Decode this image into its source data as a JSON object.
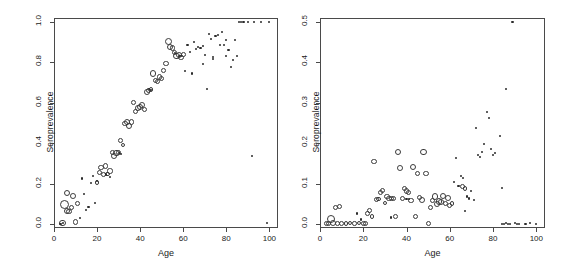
{
  "figure": {
    "background": "#ffffff",
    "frame_color": "#4a4a4a",
    "marker_color": "#3a3a3a"
  },
  "chart_data": [
    {
      "type": "scatter",
      "panel": "left",
      "title": "",
      "xlabel": "Age",
      "ylabel": "Seroprevalence",
      "xlim": [
        0,
        104
      ],
      "ylim": [
        -0.02,
        1.02
      ],
      "xticks": [
        0,
        20,
        40,
        60,
        80,
        100
      ],
      "xtick_labels": [
        "0",
        "20",
        "40",
        "60",
        "80",
        "100"
      ],
      "yticks": [
        0.0,
        0.2,
        0.4,
        0.6,
        0.8,
        1.0
      ],
      "ytick_labels": [
        "0.0",
        "0.2",
        "0.4",
        "0.6",
        "0.8",
        "1.0"
      ],
      "grid": false,
      "legend": "none",
      "series": [
        {
          "name": "weighted-open-circles",
          "marker": "open-circle",
          "points": [
            [
              4,
              0.005,
              3.2
            ],
            [
              5,
              0.095,
              4.6
            ],
            [
              6,
              0.063,
              3.0
            ],
            [
              6,
              0.152,
              3.1
            ],
            [
              7,
              0.06,
              2.6
            ],
            [
              8,
              0.083,
              2.6
            ],
            [
              9,
              0.137,
              2.9
            ],
            [
              10,
              0.01,
              2.6
            ],
            [
              11,
              0.101,
              2.4
            ],
            [
              20,
              0.205,
              2.2
            ],
            [
              21,
              0.255,
              2.6
            ],
            [
              22,
              0.28,
              2.9
            ],
            [
              23,
              0.243,
              2.4
            ],
            [
              24,
              0.287,
              2.6
            ],
            [
              25,
              0.247,
              2.4
            ],
            [
              26,
              0.262,
              2.6
            ],
            [
              27,
              0.352,
              2.4
            ],
            [
              28,
              0.338,
              2.9
            ],
            [
              29,
              0.351,
              3.4
            ],
            [
              30,
              0.353,
              2.6
            ],
            [
              31,
              0.412,
              2.4
            ],
            [
              32,
              0.39,
              2.2
            ],
            [
              33,
              0.497,
              2.6
            ],
            [
              34,
              0.503,
              3.1
            ],
            [
              35,
              0.487,
              3.1
            ],
            [
              36,
              0.505,
              2.6
            ],
            [
              37,
              0.601,
              2.4
            ],
            [
              38,
              0.555,
              2.6
            ],
            [
              39,
              0.573,
              2.9
            ],
            [
              40,
              0.58,
              3.1
            ],
            [
              41,
              0.589,
              2.9
            ],
            [
              42,
              0.567,
              2.6
            ],
            [
              43,
              0.655,
              2.9
            ],
            [
              44,
              0.66,
              2.6
            ],
            [
              45,
              0.664,
              2.4
            ],
            [
              46,
              0.745,
              3.1
            ],
            [
              47,
              0.712,
              2.6
            ],
            [
              48,
              0.705,
              2.6
            ],
            [
              49,
              0.728,
              2.9
            ],
            [
              50,
              0.719,
              2.6
            ],
            [
              51,
              0.76,
              2.4
            ],
            [
              52,
              0.793,
              2.6
            ],
            [
              53,
              0.905,
              3.6
            ],
            [
              54,
              0.878,
              3.1
            ],
            [
              55,
              0.872,
              2.9
            ],
            [
              56,
              0.848,
              2.6
            ],
            [
              57,
              0.832,
              3.4
            ],
            [
              58,
              0.836,
              2.9
            ],
            [
              59,
              0.826,
              2.6
            ],
            [
              60,
              0.838,
              2.4
            ]
          ]
        },
        {
          "name": "small-dots",
          "marker": "dot",
          "points": [
            [
              3,
              0.002
            ],
            [
              4,
              0.003
            ],
            [
              12,
              0.031
            ],
            [
              13,
              0.225
            ],
            [
              14,
              0.148
            ],
            [
              15,
              0.068
            ],
            [
              16,
              0.086
            ],
            [
              17,
              0.205
            ],
            [
              18,
              0.238
            ],
            [
              19,
              0.103
            ],
            [
              20,
              0.212
            ],
            [
              24,
              0.245
            ],
            [
              26,
              0.233
            ],
            [
              30,
              0.35
            ],
            [
              31,
              0.345
            ],
            [
              44,
              0.668
            ],
            [
              45,
              0.662
            ],
            [
              56,
              0.845
            ],
            [
              58,
              0.833
            ],
            [
              59,
              0.83
            ],
            [
              61,
              0.757
            ],
            [
              62,
              0.887
            ],
            [
              63,
              0.852
            ],
            [
              64,
              0.745
            ],
            [
              65,
              0.901
            ],
            [
              66,
              0.866
            ],
            [
              67,
              0.878
            ],
            [
              68,
              0.872
            ],
            [
              69,
              0.881
            ],
            [
              70,
              0.838
            ],
            [
              71,
              0.668
            ],
            [
              72,
              0.94
            ],
            [
              73,
              0.918
            ],
            [
              74,
              0.825
            ],
            [
              75,
              0.93
            ],
            [
              76,
              0.935
            ],
            [
              77,
              0.887
            ],
            [
              78,
              0.951
            ],
            [
              79,
              0.886
            ],
            [
              80,
              0.833
            ],
            [
              81,
              0.862
            ],
            [
              82,
              0.776
            ],
            [
              83,
              0.812
            ],
            [
              84,
              0.909
            ],
            [
              85,
              0.832
            ],
            [
              86,
              1.0
            ],
            [
              87,
              1.0
            ],
            [
              88,
              1.0
            ],
            [
              90,
              1.0
            ],
            [
              93,
              1.0
            ],
            [
              96,
              1.0
            ],
            [
              100,
              1.0
            ],
            [
              92,
              0.335
            ],
            [
              99,
              0.006
            ],
            [
              69,
              0.792
            ],
            [
              74,
              0.816
            ],
            [
              80,
              0.913
            ]
          ]
        }
      ]
    },
    {
      "type": "scatter",
      "panel": "right",
      "title": "",
      "xlabel": "Age",
      "ylabel": "Seroprevalence",
      "xlim": [
        0,
        104
      ],
      "ylim": [
        -0.01,
        0.51
      ],
      "xticks": [
        0,
        20,
        40,
        60,
        80,
        100
      ],
      "xtick_labels": [
        "0",
        "20",
        "40",
        "60",
        "80",
        "100"
      ],
      "yticks": [
        0.0,
        0.1,
        0.2,
        0.3,
        0.4,
        0.5
      ],
      "ytick_labels": [
        "0.0",
        "0.1",
        "0.2",
        "0.3",
        "0.4",
        "0.5"
      ],
      "grid": false,
      "legend": "none",
      "series": [
        {
          "name": "weighted-open-circles",
          "marker": "open-circle",
          "points": [
            [
              3,
              0.001,
              2.4
            ],
            [
              4,
              0.002,
              2.6
            ],
            [
              5,
              0.012,
              4.2
            ],
            [
              6,
              0.003,
              2.9
            ],
            [
              7,
              0.04,
              2.6
            ],
            [
              8,
              0.001,
              2.4
            ],
            [
              9,
              0.043,
              2.9
            ],
            [
              10,
              0.002,
              2.4
            ],
            [
              12,
              0.001,
              2.2
            ],
            [
              14,
              0.002,
              2.2
            ],
            [
              16,
              0.001,
              2.2
            ],
            [
              18,
              0.002,
              2.2
            ],
            [
              20,
              0.001,
              2.4
            ],
            [
              21,
              0.001,
              2.6
            ],
            [
              22,
              0.026,
              2.4
            ],
            [
              23,
              0.034,
              2.4
            ],
            [
              24,
              0.018,
              2.2
            ],
            [
              25,
              0.155,
              2.6
            ],
            [
              26,
              0.06,
              2.6
            ],
            [
              27,
              0.062,
              2.4
            ],
            [
              28,
              0.078,
              2.9
            ],
            [
              29,
              0.082,
              2.6
            ],
            [
              30,
              0.052,
              2.4
            ],
            [
              31,
              0.068,
              2.6
            ],
            [
              32,
              0.063,
              2.9
            ],
            [
              33,
              0.063,
              2.6
            ],
            [
              34,
              0.063,
              2.6
            ],
            [
              35,
              0.018,
              2.4
            ],
            [
              36,
              0.178,
              3.1
            ],
            [
              37,
              0.138,
              2.9
            ],
            [
              38,
              0.063,
              2.6
            ],
            [
              39,
              0.088,
              2.6
            ],
            [
              40,
              0.082,
              2.9
            ],
            [
              41,
              0.078,
              2.6
            ],
            [
              42,
              0.058,
              2.9
            ],
            [
              43,
              0.142,
              3.1
            ],
            [
              44,
              0.018,
              2.6
            ],
            [
              45,
              0.124,
              2.6
            ],
            [
              46,
              0.066,
              2.6
            ],
            [
              47,
              0.06,
              2.9
            ],
            [
              48,
              0.178,
              3.4
            ],
            [
              49,
              0.124,
              2.6
            ],
            [
              50,
              0.002,
              2.6
            ],
            [
              51,
              0.04,
              2.6
            ],
            [
              52,
              0.058,
              2.6
            ],
            [
              53,
              0.068,
              3.1
            ],
            [
              54,
              0.05,
              2.9
            ],
            [
              55,
              0.055,
              3.4
            ],
            [
              56,
              0.054,
              2.9
            ],
            [
              57,
              0.07,
              3.1
            ],
            [
              58,
              0.05,
              2.6
            ],
            [
              59,
              0.064,
              2.9
            ],
            [
              60,
              0.046,
              2.6
            ],
            [
              61,
              0.051,
              2.4
            ],
            [
              66,
              0.092,
              2.4
            ],
            [
              67,
              0.088,
              2.4
            ]
          ]
        },
        {
          "name": "small-dots",
          "marker": "dot",
          "points": [
            [
              17,
              0.026
            ],
            [
              19,
              0.011
            ],
            [
              33,
              0.016
            ],
            [
              40,
              0.062
            ],
            [
              41,
              0.061
            ],
            [
              62,
              0.105
            ],
            [
              63,
              0.164
            ],
            [
              64,
              0.095
            ],
            [
              65,
              0.118
            ],
            [
              66,
              0.113
            ],
            [
              67,
              0.033
            ],
            [
              68,
              0.068
            ],
            [
              69,
              0.063
            ],
            [
              70,
              0.082
            ],
            [
              71,
              0.06
            ],
            [
              72,
              0.237
            ],
            [
              73,
              0.17
            ],
            [
              74,
              0.165
            ],
            [
              75,
              0.178
            ],
            [
              76,
              0.197
            ],
            [
              77,
              0.278
            ],
            [
              78,
              0.262
            ],
            [
              79,
              0.185
            ],
            [
              80,
              0.17
            ],
            [
              81,
              0.175
            ],
            [
              83,
              0.218
            ],
            [
              84,
              0.089
            ],
            [
              89,
              0.5
            ],
            [
              86,
              0.334
            ],
            [
              84,
              0.001
            ],
            [
              85,
              0.001
            ],
            [
              86,
              0.002
            ],
            [
              87,
              0.001
            ],
            [
              88,
              0.001
            ],
            [
              90,
              0.002
            ],
            [
              91,
              0.001
            ],
            [
              92,
              0.001
            ],
            [
              95,
              0.001
            ],
            [
              97,
              0.002
            ],
            [
              100,
              0.001
            ]
          ]
        }
      ]
    }
  ]
}
